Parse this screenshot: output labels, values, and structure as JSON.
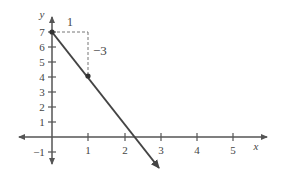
{
  "graph": {
    "x_axis_label": "x",
    "y_axis_label": "y",
    "x_tick_labels": [
      "1",
      "2",
      "3",
      "4",
      "5"
    ],
    "y_tick_labels": [
      "7",
      "6",
      "5",
      "4",
      "3",
      "2",
      "1",
      "−1"
    ],
    "run_label": "1",
    "rise_label": "−3",
    "line": {
      "description": "line through (0, 7) and (1, 4) with slope -3",
      "points": [
        [
          0,
          7
        ],
        [
          1,
          4
        ]
      ],
      "slope": -3,
      "y_intercept": 7
    },
    "colors": {
      "axis": "#555555",
      "line": "#444444",
      "dashed": "#777777",
      "text": "#444444"
    }
  }
}
